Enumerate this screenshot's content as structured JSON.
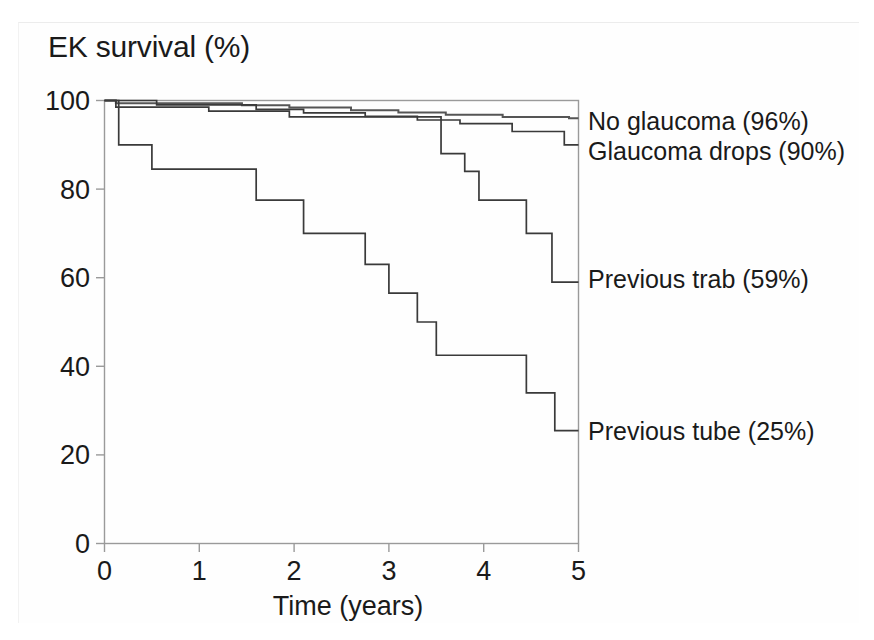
{
  "chart_data": {
    "type": "line",
    "title": "EK survival (%)",
    "xlabel": "Time (years)",
    "ylabel": "EK survival (%)",
    "xlim": [
      0,
      5
    ],
    "ylim": [
      0,
      100
    ],
    "xticks": [
      "0",
      "1",
      "2",
      "3",
      "4",
      "5"
    ],
    "yticks": [
      "0",
      "20",
      "40",
      "60",
      "80",
      "100"
    ],
    "grid": false,
    "legend_position": "right-inline-annotations",
    "series": [
      {
        "name": "No glaucoma",
        "label": "No glaucoma (96%)",
        "final_value": 96,
        "steps": [
          [
            0.0,
            100
          ],
          [
            0.12,
            100
          ],
          [
            0.12,
            99.4
          ],
          [
            1.45,
            99.4
          ],
          [
            1.45,
            98.9
          ],
          [
            1.95,
            98.9
          ],
          [
            1.95,
            98.4
          ],
          [
            2.6,
            98.4
          ],
          [
            2.6,
            97.8
          ],
          [
            3.1,
            97.8
          ],
          [
            3.1,
            97.3
          ],
          [
            3.6,
            97.3
          ],
          [
            3.6,
            96.8
          ],
          [
            4.2,
            96.8
          ],
          [
            4.2,
            96.3
          ],
          [
            4.9,
            96.3
          ],
          [
            4.9,
            96.0
          ],
          [
            5.0,
            96.0
          ]
        ]
      },
      {
        "name": "Glaucoma drops",
        "label": "Glaucoma drops (90%)",
        "final_value": 90,
        "steps": [
          [
            0.0,
            100
          ],
          [
            0.55,
            100
          ],
          [
            0.55,
            99.0
          ],
          [
            1.6,
            99.0
          ],
          [
            1.6,
            98.0
          ],
          [
            2.1,
            98.0
          ],
          [
            2.1,
            97.2
          ],
          [
            2.75,
            97.2
          ],
          [
            2.75,
            96.4
          ],
          [
            3.3,
            96.4
          ],
          [
            3.3,
            95.6
          ],
          [
            3.75,
            95.6
          ],
          [
            3.75,
            94.8
          ],
          [
            4.3,
            94.8
          ],
          [
            4.3,
            93.0
          ],
          [
            4.85,
            93.0
          ],
          [
            4.85,
            90.0
          ],
          [
            5.0,
            90.0
          ]
        ]
      },
      {
        "name": "Previous trab",
        "label": "Previous trab (59%)",
        "final_value": 59,
        "steps": [
          [
            0.0,
            100
          ],
          [
            0.12,
            100
          ],
          [
            0.12,
            98.5
          ],
          [
            1.1,
            98.5
          ],
          [
            1.1,
            97.6
          ],
          [
            1.95,
            97.6
          ],
          [
            1.95,
            96.3
          ],
          [
            3.55,
            96.3
          ],
          [
            3.55,
            88.0
          ],
          [
            3.8,
            88.0
          ],
          [
            3.8,
            84.0
          ],
          [
            3.95,
            84.0
          ],
          [
            3.95,
            77.5
          ],
          [
            4.45,
            77.5
          ],
          [
            4.45,
            70.0
          ],
          [
            4.72,
            70.0
          ],
          [
            4.72,
            59.0
          ],
          [
            5.0,
            59.0
          ]
        ]
      },
      {
        "name": "Previous tube",
        "label": "Previous tube (25%)",
        "final_value": 25,
        "steps": [
          [
            0.0,
            100
          ],
          [
            0.15,
            100
          ],
          [
            0.15,
            90.0
          ],
          [
            0.5,
            90.0
          ],
          [
            0.5,
            84.5
          ],
          [
            1.6,
            84.5
          ],
          [
            1.6,
            77.5
          ],
          [
            2.1,
            77.5
          ],
          [
            2.1,
            70.0
          ],
          [
            2.75,
            70.0
          ],
          [
            2.75,
            63.0
          ],
          [
            3.0,
            63.0
          ],
          [
            3.0,
            56.5
          ],
          [
            3.3,
            56.5
          ],
          [
            3.3,
            50.0
          ],
          [
            3.5,
            50.0
          ],
          [
            3.5,
            42.5
          ],
          [
            4.45,
            42.5
          ],
          [
            4.45,
            34.0
          ],
          [
            4.75,
            34.0
          ],
          [
            4.75,
            25.5
          ],
          [
            5.0,
            25.5
          ]
        ]
      }
    ],
    "annotations": [
      {
        "text": "No glaucoma (96%)",
        "at_x": 5.0,
        "at_y": 96
      },
      {
        "text": "Glaucoma drops (90%)",
        "at_x": 5.0,
        "at_y": 90
      },
      {
        "text": "Previous trab (59%)",
        "at_x": 5.0,
        "at_y": 59
      },
      {
        "text": "Previous tube (25%)",
        "at_x": 5.0,
        "at_y": 25
      }
    ]
  }
}
